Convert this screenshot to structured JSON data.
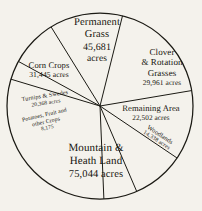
{
  "chart_data": {
    "type": "pie",
    "title": "",
    "unit": "acres",
    "total": 247514,
    "center": [
      100,
      106
    ],
    "radius": 93,
    "start_angle_deg": -76,
    "direction": "clockwise",
    "stroke_color": "#1b1a14",
    "background_color": "#f4f2ec",
    "labels": [
      "Permanent Grass",
      "Clover & Rotation Grasses",
      "Remaining Area",
      "Woodlands",
      "Mountain & Heath Land",
      "Potatoes, Fruit and other Crops",
      "Turnips & Swedes",
      "Corn Crops"
    ],
    "values": [
      45681,
      29961,
      22502,
      14338,
      75044,
      8175,
      20368,
      31445
    ],
    "slices": [
      {
        "name": "permanent-grass",
        "label": "Permanent Grass",
        "value": 45681,
        "value_text": "45,681"
      },
      {
        "name": "clover-rotation-grasses",
        "label": "Clover & Rotation Grasses",
        "value": 29961,
        "value_text": "29,961"
      },
      {
        "name": "remaining-area",
        "label": "Remaining Area",
        "value": 22502,
        "value_text": "22,502"
      },
      {
        "name": "woodlands",
        "label": "Woodlands",
        "value": 14338,
        "value_text": "14,338"
      },
      {
        "name": "mountain-heath-land",
        "label": "Mountain & Heath Land",
        "value": 75044,
        "value_text": "75,044"
      },
      {
        "name": "potatoes-fruit-other-crops",
        "label": "Potatoes, Fruit and other Crops",
        "value": 8175,
        "value_text": "8,175"
      },
      {
        "name": "turnips-swedes",
        "label": "Turnips & Swedes",
        "value": 20368,
        "value_text": "20,368"
      },
      {
        "name": "corn-crops",
        "label": "Corn Crops",
        "value": 31445,
        "value_text": "31,445"
      }
    ]
  },
  "labels": {
    "permanent_grass": {
      "line1": "Permanent",
      "line2": "Grass",
      "value": "45,681",
      "unit": "acres"
    },
    "clover": {
      "line1": "Clover",
      "line2": "& Rotation",
      "line3": "Grasses",
      "value": "29,961 acres"
    },
    "corn_crops": {
      "line1": "Corn Crops",
      "value": "31,445 acres"
    },
    "remaining_area": {
      "line1": "Remaining  Area",
      "value": "22,502 acres"
    },
    "mountain_heath": {
      "line1": "Mountain  &",
      "line2": "Heath Land",
      "value": "75,044 acres"
    },
    "turnips": {
      "line1": "Turnips  &  Swedes",
      "value": "20,368 acres"
    },
    "potatoes": {
      "line1": "Potatoes, Fruit and",
      "line2": "other Crops",
      "value": "8,175"
    },
    "woodlands": {
      "line1": "Woodlands",
      "value": "14,338 acres"
    }
  }
}
